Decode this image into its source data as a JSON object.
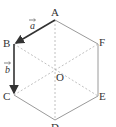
{
  "diagram": {
    "type": "regular hexagon with center and vectors",
    "colors": {
      "edge": "#9a9a9a",
      "dashed": "#b0b0b0",
      "vector": "#333333",
      "text": "#333333"
    },
    "vertices": {
      "A": {
        "label": "A",
        "x": 55,
        "y": 20
      },
      "B": {
        "label": "B",
        "x": 14,
        "y": 44
      },
      "C": {
        "label": "C",
        "x": 14,
        "y": 95
      },
      "D": {
        "label": "D",
        "x": 55,
        "y": 120
      },
      "E": {
        "label": "E",
        "x": 98,
        "y": 96
      },
      "F": {
        "label": "F",
        "x": 98,
        "y": 44
      },
      "O": {
        "label": "O",
        "x": 55,
        "y": 70
      }
    },
    "vectors": [
      {
        "name": "a",
        "label": "a",
        "from": "A",
        "to": "B"
      },
      {
        "name": "b",
        "label": "b",
        "from": "B",
        "to": "C"
      }
    ],
    "dashed_segments": [
      "A-D",
      "B-E",
      "C-F"
    ]
  }
}
